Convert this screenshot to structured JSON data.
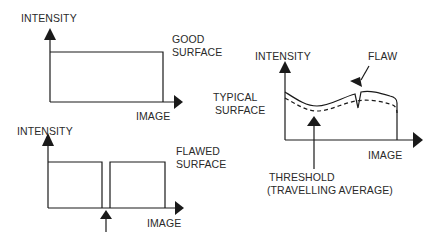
{
  "panels": {
    "good_surface": {
      "y_axis_label": "INTENSITY",
      "x_axis_label": "IMAGE",
      "caption_line1": "GOOD",
      "caption_line2": "SURFACE"
    },
    "flawed_surface": {
      "y_axis_label": "INTENSITY",
      "x_axis_label": "IMAGE",
      "caption_line1": "FLAWED",
      "caption_line2": "SURFACE"
    },
    "typical_surface": {
      "y_axis_label": "INTENSITY",
      "x_axis_label": "IMAGE",
      "caption_line1": "TYPICAL",
      "caption_line2": "SURFACE",
      "flaw_label": "FLAW",
      "threshold_line1": "THRESHOLD",
      "threshold_line2": "(TRAVELLING AVERAGE)"
    }
  },
  "colors": {
    "line": "#1a1a1a",
    "text": "#2a2a2a",
    "background": "#ffffff"
  }
}
